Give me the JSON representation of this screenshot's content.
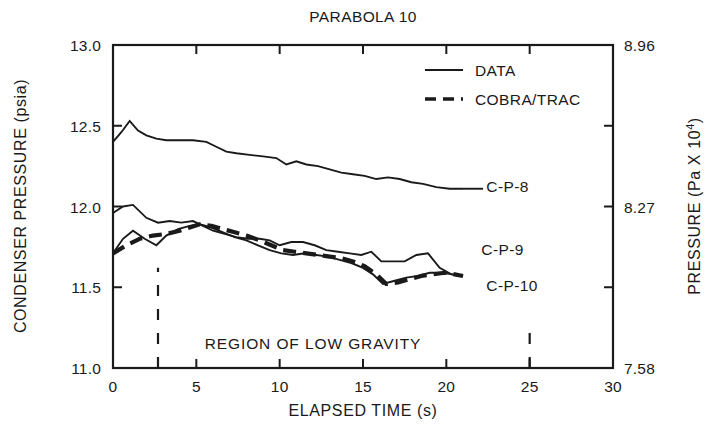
{
  "chart_data": {
    "type": "line",
    "title": "PARABOLA 10",
    "xlabel": "ELAPSED TIME (s)",
    "ylabel": "CONDENSER PRESSURE (psia)",
    "ylabel_right": "PRESSURE (Pa X 10",
    "ylabel_right_exp": "4",
    "ylabel_right_close": ")",
    "xlim": [
      0,
      30
    ],
    "ylim": [
      11.0,
      13.0
    ],
    "ylim_right": [
      7.58,
      8.96
    ],
    "grid": false,
    "xticks": [
      0,
      5,
      10,
      15,
      20,
      25,
      30
    ],
    "xticklabels": [
      "0",
      "5",
      "10",
      "15",
      "20",
      "25",
      "30"
    ],
    "yticks": [
      11.0,
      11.5,
      12.0,
      12.5,
      13.0
    ],
    "yticklabels": [
      "11.0",
      "11.5",
      "12.0",
      "12.5",
      "13.0"
    ],
    "yticks_right": [
      7.58,
      8.27,
      8.96
    ],
    "yticklabels_right": [
      "7.58",
      "8.27",
      "8.96"
    ],
    "legend_position": "upper-right",
    "legend": [
      {
        "label": "DATA",
        "style": "solid"
      },
      {
        "label": "COBRA/TRAC",
        "style": "dashed"
      }
    ],
    "annotations": [
      {
        "text": "REGION OF LOW GRAVITY",
        "x": 12.0,
        "y": 11.15
      },
      {
        "text": "C-P-8",
        "x": 22.4,
        "y": 12.12
      },
      {
        "text": "C-P-9",
        "x": 22.1,
        "y": 11.73
      },
      {
        "text": "C-P-10",
        "x": 22.4,
        "y": 11.51
      }
    ],
    "region_markers": [
      {
        "x": 2.7,
        "style": "dashed",
        "y_from": 11.0,
        "y_to": 11.62
      },
      {
        "x": 25.0,
        "style": "dashed",
        "y_from": 11.0,
        "y_to": 11.24
      }
    ],
    "series": [
      {
        "name": "C-P-8",
        "style": "solid",
        "x": [
          0,
          0.5,
          1,
          1.5,
          2,
          2.6,
          3.2,
          4,
          4.8,
          5.6,
          6.2,
          6.8,
          7.4,
          8.2,
          9,
          9.8,
          10.4,
          11,
          11.6,
          12.3,
          13,
          13.7,
          14.4,
          15.1,
          15.8,
          16.5,
          17.2,
          17.9,
          18.6,
          19.4,
          20.2,
          21
        ],
        "y": [
          12.4,
          12.46,
          12.53,
          12.47,
          12.44,
          12.42,
          12.41,
          12.41,
          12.41,
          12.4,
          12.37,
          12.34,
          12.33,
          12.32,
          12.31,
          12.3,
          12.26,
          12.28,
          12.26,
          12.25,
          12.23,
          12.21,
          12.2,
          12.19,
          12.17,
          12.18,
          12.17,
          12.15,
          12.14,
          12.12,
          12.11,
          12.11
        ]
      },
      {
        "name": "C-P-9",
        "style": "solid",
        "x": [
          0,
          0.6,
          1.2,
          2,
          2.7,
          3.4,
          4.1,
          4.8,
          5.4,
          6,
          6.7,
          7.4,
          8.1,
          8.8,
          9.4,
          10,
          10.7,
          11.4,
          12.1,
          12.8,
          13.5,
          14.2,
          14.9,
          15.5,
          16.1,
          16.8,
          17.5,
          18.2,
          18.9,
          19.6,
          20.3,
          21
        ],
        "y": [
          11.96,
          12.0,
          12.01,
          11.93,
          11.9,
          11.91,
          11.9,
          11.91,
          11.88,
          11.85,
          11.83,
          11.81,
          11.8,
          11.8,
          11.79,
          11.76,
          11.78,
          11.78,
          11.76,
          11.73,
          11.72,
          11.71,
          11.7,
          11.72,
          11.66,
          11.66,
          11.66,
          11.7,
          11.71,
          11.62,
          11.58,
          11.57
        ]
      },
      {
        "name": "C-P-10",
        "style": "solid",
        "x": [
          0,
          0.6,
          1.2,
          1.9,
          2.6,
          3.2,
          3.9,
          4.6,
          5.2,
          5.9,
          6.6,
          7.3,
          8,
          8.7,
          9.4,
          10.1,
          10.8,
          11.5,
          12.2,
          12.9,
          13.6,
          14.3,
          15,
          15.6,
          16.2,
          16.9,
          17.6,
          18.3,
          19,
          19.7,
          20.4,
          21
        ],
        "y": [
          11.71,
          11.8,
          11.85,
          11.8,
          11.76,
          11.82,
          11.86,
          11.88,
          11.89,
          11.87,
          11.84,
          11.81,
          11.79,
          11.76,
          11.73,
          11.71,
          11.7,
          11.71,
          11.7,
          11.69,
          11.67,
          11.65,
          11.62,
          11.58,
          11.52,
          11.54,
          11.56,
          11.57,
          11.59,
          11.59,
          11.58,
          11.57
        ]
      },
      {
        "name": "COBRA/TRAC",
        "style": "dashed",
        "x": [
          0,
          0.8,
          1.6,
          2.4,
          3.2,
          4,
          4.6,
          5.2,
          5.9,
          6.6,
          7.3,
          8,
          8.8,
          9.5,
          10.2,
          10.9,
          11.6,
          12.3,
          13,
          13.7,
          14.4,
          15.1,
          15.8,
          16.4,
          17.1,
          17.8,
          18.5,
          19.2,
          19.9,
          20.5,
          21
        ],
        "y": [
          11.71,
          11.76,
          11.8,
          11.82,
          11.83,
          11.85,
          11.87,
          11.89,
          11.88,
          11.86,
          11.84,
          11.82,
          11.79,
          11.76,
          11.73,
          11.72,
          11.71,
          11.7,
          11.69,
          11.68,
          11.66,
          11.63,
          11.58,
          11.52,
          11.53,
          11.55,
          11.57,
          11.58,
          11.59,
          11.58,
          11.57
        ]
      }
    ]
  }
}
